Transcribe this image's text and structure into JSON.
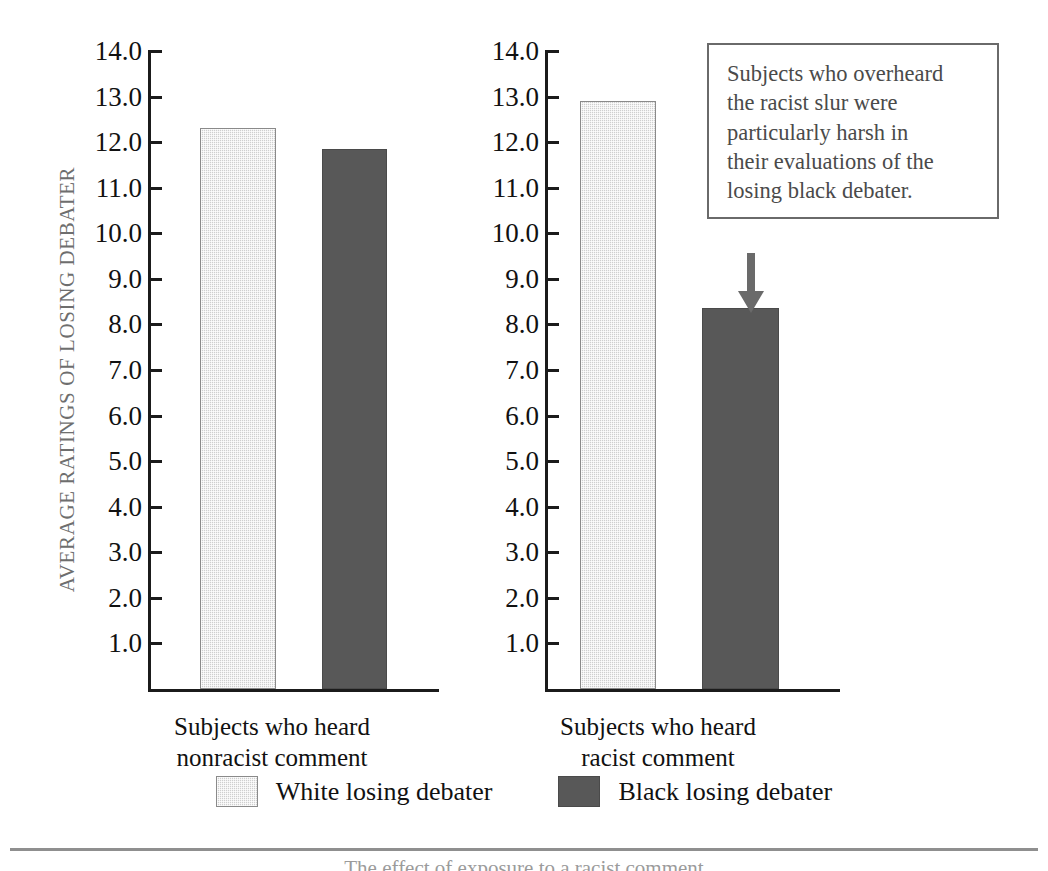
{
  "chart_data": {
    "type": "bar",
    "title": "",
    "subtitle": "",
    "xlabel": "",
    "ylabel": "AVERAGE RATINGS OF LOSING DEBATER",
    "ylim": [
      0,
      14
    ],
    "yticks": [
      "14.0",
      "13.0",
      "12.0",
      "11.0",
      "10.0",
      "9.0",
      "8.0",
      "7.0",
      "6.0",
      "5.0",
      "4.0",
      "3.0",
      "2.0",
      "1.0"
    ],
    "ytick_values": [
      14.0,
      13.0,
      12.0,
      11.0,
      10.0,
      9.0,
      8.0,
      7.0,
      6.0,
      5.0,
      4.0,
      3.0,
      2.0,
      1.0
    ],
    "grid": false,
    "legend_position": "bottom",
    "categories": [
      "Subjects who heard nonracist comment",
      "Subjects who heard racist comment"
    ],
    "series": [
      {
        "name": "White losing debater",
        "values": [
          12.3,
          12.9
        ],
        "color": "#cfcfcf"
      },
      {
        "name": "Black losing debater",
        "values": [
          11.85,
          8.35
        ],
        "color": "#585858"
      }
    ],
    "annotations": [
      {
        "text": "Subjects who overheard the racist slur were particularly harsh in their evaluations of the losing black debater.",
        "points_to": {
          "category": "Subjects who heard racist comment",
          "series": "Black losing debater",
          "value": 8.35
        }
      }
    ]
  },
  "axis": {
    "y_title": "AVERAGE RATINGS OF LOSING DEBATER",
    "tick_labels": [
      "14.0",
      "13.0",
      "12.0",
      "11.0",
      "10.0",
      "9.0",
      "8.0",
      "7.0",
      "6.0",
      "5.0",
      "4.0",
      "3.0",
      "2.0",
      "1.0"
    ]
  },
  "panels": [
    {
      "category_line1": "Subjects who heard",
      "category_line2": "nonracist comment",
      "bars": [
        {
          "series": "White losing debater",
          "value": 12.3
        },
        {
          "series": "Black losing debater",
          "value": 11.85
        }
      ]
    },
    {
      "category_line1": "Subjects who heard",
      "category_line2": "racist comment",
      "bars": [
        {
          "series": "White losing debater",
          "value": 12.9
        },
        {
          "series": "Black losing debater",
          "value": 8.35
        }
      ]
    }
  ],
  "callout": {
    "line1": "Subjects who overheard",
    "line2": "the racist slur were",
    "line3": "particularly harsh in",
    "line4": "their evaluations of the",
    "line5": "losing black debater."
  },
  "legend": {
    "items": [
      {
        "label": "White losing debater",
        "swatch": "white-swatch"
      },
      {
        "label": "Black losing debater",
        "swatch": "black-swatch"
      }
    ]
  },
  "footer": {
    "caption": "The effect of exposure to a racist comment"
  },
  "colors": {
    "white_bar": "#cfcfcf",
    "black_bar": "#585858",
    "axis": "#1b1b1b",
    "callout_border": "#6a6a6a",
    "callout_text": "#4a4a4a",
    "y_title": "#6e6e6e"
  }
}
